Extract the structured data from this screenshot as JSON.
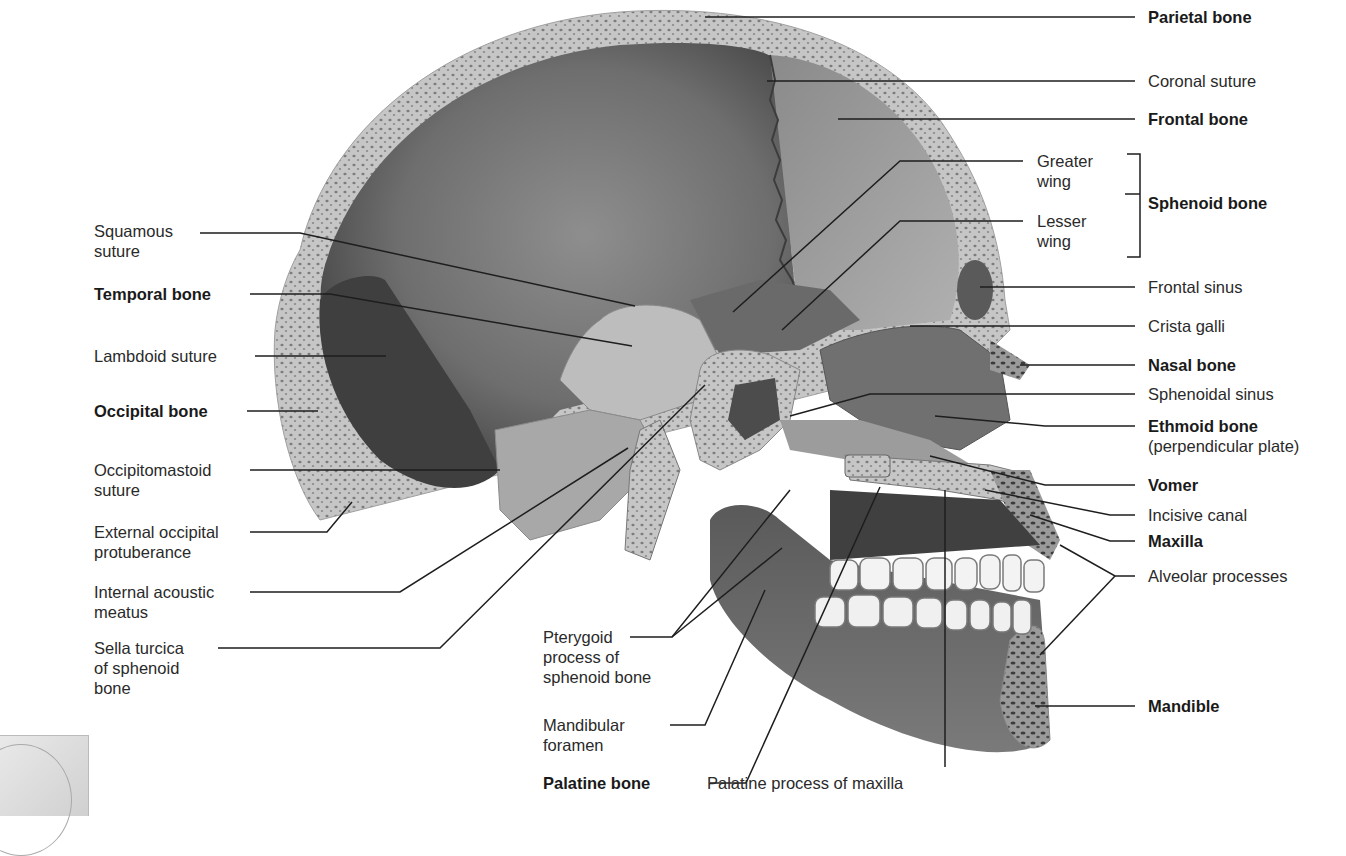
{
  "diagram": {
    "colors": {
      "background": "#ffffff",
      "bone_dark": "#4a4a4a",
      "bone_mid": "#7a7a7a",
      "bone_light": "#b8b8b8",
      "cancellous_rim": "#c9c9c9",
      "teeth": "#f2f2f2",
      "leader_line": "#1e1e1e",
      "label_text": "#222222"
    },
    "labels_left": [
      {
        "id": "squamous-suture",
        "line1": "Squamous",
        "line2": "suture",
        "bold": false
      },
      {
        "id": "temporal-bone",
        "line1": "Temporal bone",
        "line2": "",
        "bold": true
      },
      {
        "id": "lambdoid-suture",
        "line1": "Lambdoid suture",
        "line2": "",
        "bold": false
      },
      {
        "id": "occipital-bone",
        "line1": "Occipital bone",
        "line2": "",
        "bold": true
      },
      {
        "id": "occipitomastoid-suture",
        "line1": "Occipitomastoid",
        "line2": "suture",
        "bold": false
      },
      {
        "id": "external-occipital-protuberance",
        "line1": "External occipital",
        "line2": "protuberance",
        "bold": false
      },
      {
        "id": "internal-acoustic-meatus",
        "line1": "Internal acoustic",
        "line2": "meatus",
        "bold": false
      },
      {
        "id": "sella-turcica",
        "line1": "Sella turcica",
        "line2": "of sphenoid",
        "line3": "bone",
        "bold": false
      }
    ],
    "labels_bottom": [
      {
        "id": "pterygoid-process",
        "line1": "Pterygoid",
        "line2": "process of",
        "line3": "sphenoid bone",
        "bold": false
      },
      {
        "id": "mandibular-foramen",
        "line1": "Mandibular",
        "line2": "foramen",
        "bold": false
      },
      {
        "id": "palatine-bone",
        "line1": "Palatine bone",
        "bold": true
      },
      {
        "id": "palatine-process-of-maxilla",
        "line1": "Palatine process of maxilla",
        "bold": false
      }
    ],
    "labels_right": [
      {
        "id": "parietal-bone",
        "line1": "Parietal bone",
        "bold": true
      },
      {
        "id": "coronal-suture",
        "line1": "Coronal suture",
        "bold": false
      },
      {
        "id": "frontal-bone",
        "line1": "Frontal bone",
        "bold": true
      },
      {
        "id": "greater-wing",
        "line1": "Greater",
        "line2": "wing",
        "bold": false
      },
      {
        "id": "lesser-wing",
        "line1": "Lesser",
        "line2": "wing",
        "bold": false
      },
      {
        "id": "sphenoid-bone",
        "line1": "Sphenoid bone",
        "bold": true
      },
      {
        "id": "frontal-sinus",
        "line1": "Frontal sinus",
        "bold": false
      },
      {
        "id": "crista-galli",
        "line1": "Crista galli",
        "bold": false
      },
      {
        "id": "nasal-bone",
        "line1": "Nasal bone",
        "bold": true
      },
      {
        "id": "sphenoidal-sinus",
        "line1": "Sphenoidal sinus",
        "bold": false
      },
      {
        "id": "ethmoid-bone",
        "line1": "Ethmoid bone",
        "line2": "(perpendicular plate)",
        "bold": true
      },
      {
        "id": "vomer",
        "line1": "Vomer",
        "bold": true
      },
      {
        "id": "incisive-canal",
        "line1": "Incisive canal",
        "bold": false
      },
      {
        "id": "maxilla",
        "line1": "Maxilla",
        "bold": true
      },
      {
        "id": "alveolar-processes",
        "line1": "Alveolar processes",
        "bold": false
      },
      {
        "id": "mandible",
        "line1": "Mandible",
        "bold": true
      }
    ]
  }
}
